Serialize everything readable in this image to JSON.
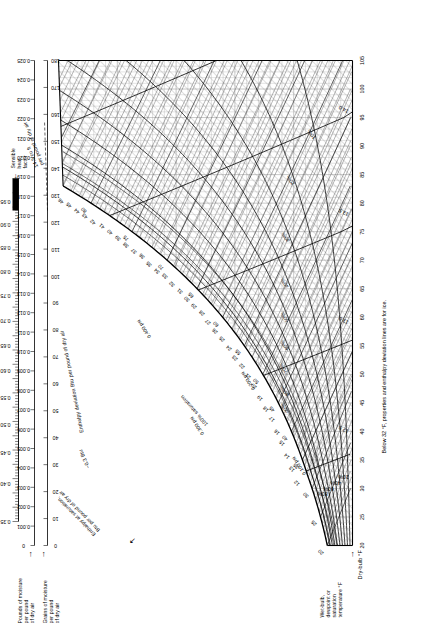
{
  "chart_data": {
    "type": "line",
    "xlabel": "Dry-bulb °F",
    "ylabel": "Pounds of moisture per pound of dry air",
    "xlim": [
      20,
      105
    ],
    "ylim": [
      0,
      0.025
    ],
    "grid": true,
    "legend": "none",
    "axes": {
      "dry_bulb": {
        "label": "Dry-bulb °F",
        "ticks": [
          20,
          25,
          30,
          35,
          40,
          45,
          50,
          55,
          60,
          65,
          70,
          75,
          80,
          85,
          90,
          95,
          100,
          105
        ],
        "min": 20,
        "max": 105,
        "minor_step": 1
      },
      "humidity_ratio": {
        "label": "Pounds of moisture per pound of dry air",
        "ticks": [
          0,
          0.001,
          0.002,
          0.003,
          0.004,
          0.005,
          0.006,
          0.007,
          0.008,
          0.009,
          0.01,
          0.011,
          0.012,
          0.013,
          0.014,
          0.015,
          0.016,
          0.017,
          0.018,
          0.019,
          0.02,
          0.021,
          0.022,
          0.023,
          0.024,
          0.025
        ],
        "min": 0,
        "max": 0.025
      },
      "grains": {
        "label": "Grains of moisture per pound of dry air",
        "ticks": [
          0,
          10,
          20,
          30,
          40,
          50,
          60,
          70,
          80,
          90,
          100,
          110,
          120,
          130,
          140,
          150,
          160,
          170,
          180
        ],
        "min": 0,
        "max": 180
      },
      "enthalpy_saturation": {
        "label": "Enthalpy at saturation, Btu per pound of dry air",
        "ticks": [
          12,
          13,
          14,
          15,
          16,
          17,
          18,
          19,
          20,
          21,
          22,
          23,
          24,
          25,
          26,
          27,
          28,
          29,
          30,
          31,
          32,
          33,
          34,
          35,
          36,
          37,
          38,
          39,
          40,
          41,
          42,
          43,
          44,
          45,
          46,
          47,
          48,
          49
        ],
        "min": 12,
        "max": 49
      },
      "sensible_heat_factor": {
        "label": "Sensible heat factor",
        "ticks": [
          0.35,
          0.4,
          0.45,
          0.5,
          0.55,
          0.6,
          0.65,
          0.7,
          0.75,
          0.8,
          0.85,
          0.9,
          0.95
        ],
        "min": 0.35,
        "max": 1.0
      }
    },
    "series": [
      {
        "name": "Relative humidity",
        "unit": "%",
        "values": [
          10,
          20,
          30,
          40,
          50,
          60,
          70,
          80,
          90,
          100
        ]
      },
      {
        "name": "Specific volume",
        "unit": "ft³ per pound of dry air",
        "values": [
          12.5,
          13.0,
          13.5,
          14.0
        ]
      },
      {
        "name": "Vapor pressure",
        "unit": "psi",
        "values": [
          0.1,
          0.2,
          0.3,
          0.4,
          0.6,
          0.8
        ]
      },
      {
        "name": "Enthalpy deviation",
        "unit": "Btu per pound of dry air",
        "values": [
          -0.3,
          -0.2,
          -0.1,
          0.0,
          0.1,
          0.2,
          0.3
        ]
      },
      {
        "name": "Wet-bulb temperature",
        "unit": "°F",
        "values": [
          20,
          25,
          30,
          35,
          40,
          45,
          50,
          55,
          60,
          65,
          70,
          75,
          80,
          85
        ]
      }
    ]
  },
  "labels": {
    "pounds_moisture": "Pounds of moisture\nper pound\nof dry air",
    "pounds_moisture_l1": "Pounds of moisture",
    "pounds_moisture_l2": "per pound",
    "pounds_moisture_l3": "of dry air",
    "grains_l1": "Grains of moisture",
    "grains_l2": "per pound",
    "grains_l3": "of dry air",
    "sensible_l1": "Sensible",
    "sensible_l2": "heat",
    "sensible_l3": "factor",
    "enthalpy_sat_l1": "Enthalpy at saturation,",
    "enthalpy_sat_l2": "Btu per pound of dry air",
    "enthalpy_dev": "Enthalpy deviation Btu per pound of dry air",
    "wetbulb_l1": "Wet-bulb,",
    "wetbulb_l2": "dewpoint or",
    "wetbulb_l3": "saturation",
    "wetbulb_l4": "temperature °F",
    "drybulb": "Dry-bulb °F",
    "footnote": "Below 32 °F, properties and enthalpy deviation lines are for ice.",
    "vol_cuft_l1": "14.5 cu ft",
    "vol_cuft_l2": "per pound of dry air",
    "saturation_curve": "100% saturation",
    "dev_03btu": "−0.3 Btu",
    "dev_02btu": "−0.2 Btu",
    "dev_01btu": "−0.1 Btu",
    "dev_0btu": "0 Btu"
  },
  "shf_ticks": [
    "0.35",
    "0.40",
    "0.45",
    "0.50",
    "0.55",
    "0.60",
    "0.65",
    "0.70",
    "0.75",
    "0.80",
    "0.85",
    "0.90",
    "0.95"
  ],
  "w_ticks": [
    "0.025",
    "0.024",
    "0.023",
    "0.022",
    "0.021",
    "0.020",
    "0.019",
    "0.018",
    "0.017",
    "0.016",
    "0.015",
    "0.014",
    "0.013",
    "0.012",
    "0.011",
    "0.010",
    "0.009",
    "0.008",
    "0.007",
    "0.006",
    "0.005",
    "0.004",
    "0.003",
    "0.002",
    "0.001",
    "0"
  ],
  "grain_ticks": [
    "180",
    "170",
    "160",
    "150",
    "140",
    "130",
    "120",
    "110",
    "100",
    "90",
    "80",
    "70",
    "60",
    "50",
    "40",
    "30",
    "20",
    "10",
    "0"
  ],
  "db_ticks": [
    "20",
    "25",
    "30",
    "35",
    "40",
    "45",
    "50",
    "55",
    "60",
    "65",
    "70",
    "75",
    "80",
    "85",
    "90",
    "95",
    "100",
    "105"
  ],
  "rh_labels": [
    "10%",
    "20%",
    "30%",
    "40%",
    "50%",
    "60%",
    "70%",
    "80%",
    "90%"
  ],
  "volume_labels": [
    "12.5",
    "13.0",
    "13.5",
    "14.0"
  ],
  "vapor_labels": [
    "0.100 psi",
    "0.200 psi",
    "0.300 psi",
    "0.400 psi",
    "0.600 psi",
    "0.800 psi"
  ],
  "enthalpy_labels": [
    "12",
    "13",
    "14",
    "15",
    "16",
    "17",
    "18",
    "19",
    "20",
    "21",
    "22",
    "23",
    "24",
    "25",
    "26",
    "27",
    "28",
    "29",
    "30",
    "31",
    "32",
    "33",
    "34",
    "35",
    "36",
    "37",
    "38",
    "39",
    "40",
    "41",
    "42",
    "43",
    "44",
    "45",
    "46",
    "47",
    "48",
    "49"
  ],
  "colors": {
    "ink": "#000000",
    "grid": "#9a9a9a",
    "hatch": "#7a7a7a",
    "paper": "#ffffff"
  }
}
